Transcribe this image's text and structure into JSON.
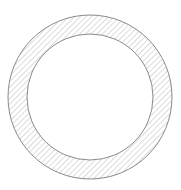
{
  "diagram": {
    "type": "annulus-cross-section",
    "center": {
      "x": 90,
      "y": 97
    },
    "outer_radius": 82,
    "inner_radius": 63,
    "hatch": {
      "direction": "diagonal-forward-slash",
      "spacing": 4,
      "color": "#b8b8b8"
    },
    "stroke_color": "#8a8a8a",
    "fill_inner": "#ffffff",
    "background": "#ffffff"
  }
}
